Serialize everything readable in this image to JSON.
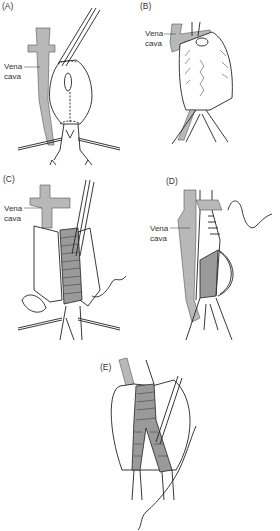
{
  "figure": {
    "panels": [
      {
        "id": "A",
        "label": "(A)",
        "annotation": "Vena\ncava",
        "annotation_lines": [
          "Vena",
          "cava"
        ]
      },
      {
        "id": "B",
        "label": "(B)",
        "annotation_lines": [
          "Vena",
          "cava"
        ]
      },
      {
        "id": "C",
        "label": "(C)",
        "annotation_lines": [
          "Vena",
          "cava"
        ]
      },
      {
        "id": "D",
        "label": "(D)",
        "annotation_lines": [
          "Vena",
          "cava"
        ]
      },
      {
        "id": "E",
        "label": "(E)"
      }
    ],
    "colors": {
      "vena_cava": "#b8b8b8",
      "graft": "#9a9a9a",
      "line": "#222222",
      "background": "#ffffff"
    }
  }
}
